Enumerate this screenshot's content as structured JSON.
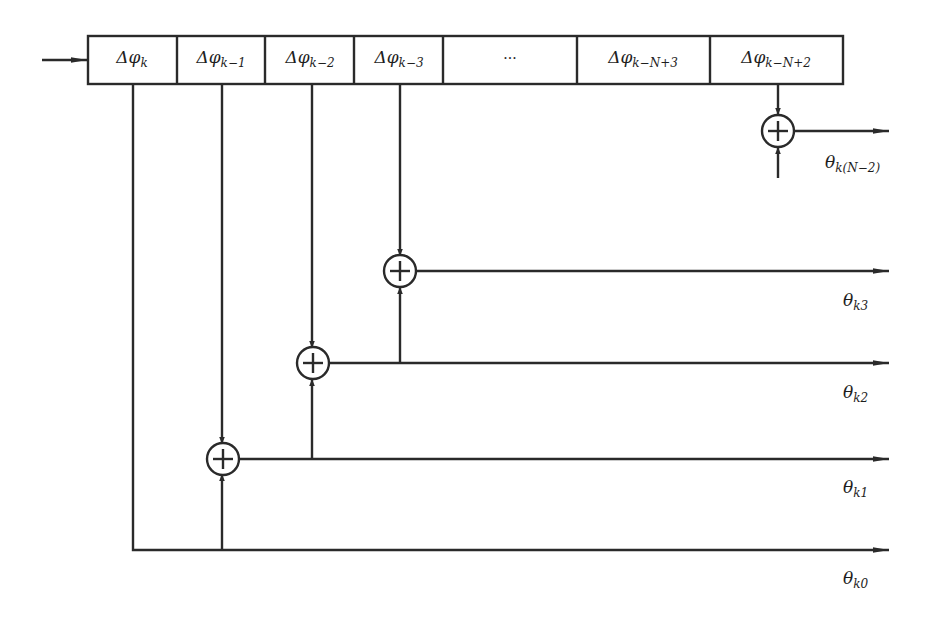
{
  "diagram": {
    "type": "shift-register-adder-tree",
    "colors": {
      "stroke": "#2a2a2a",
      "background": "#ffffff"
    },
    "register_cells": [
      {
        "symbol": "Δφ",
        "sub": "k",
        "x": 132
      },
      {
        "symbol": "Δφ",
        "sub": "k−1",
        "x": 221
      },
      {
        "symbol": "Δφ",
        "sub": "k−2",
        "x": 310
      },
      {
        "symbol": "Δφ",
        "sub": "k−3",
        "x": 399
      },
      {
        "symbol": "···",
        "sub": "",
        "x": 510
      },
      {
        "symbol": "Δφ",
        "sub": "k−N+3",
        "x": 643
      },
      {
        "symbol": "Δφ",
        "sub": "k−N+2",
        "x": 776
      }
    ],
    "adders": [
      {
        "id": "adder-1",
        "glyph": "+"
      },
      {
        "id": "adder-2",
        "glyph": "+"
      },
      {
        "id": "adder-3",
        "glyph": "+"
      },
      {
        "id": "adder-n2",
        "glyph": "+"
      }
    ],
    "outputs": [
      {
        "symbol": "θ",
        "sub": "k(N−2)"
      },
      {
        "symbol": "θ",
        "sub": "k3"
      },
      {
        "symbol": "θ",
        "sub": "k2"
      },
      {
        "symbol": "θ",
        "sub": "k1"
      },
      {
        "symbol": "θ",
        "sub": "k0"
      }
    ]
  }
}
